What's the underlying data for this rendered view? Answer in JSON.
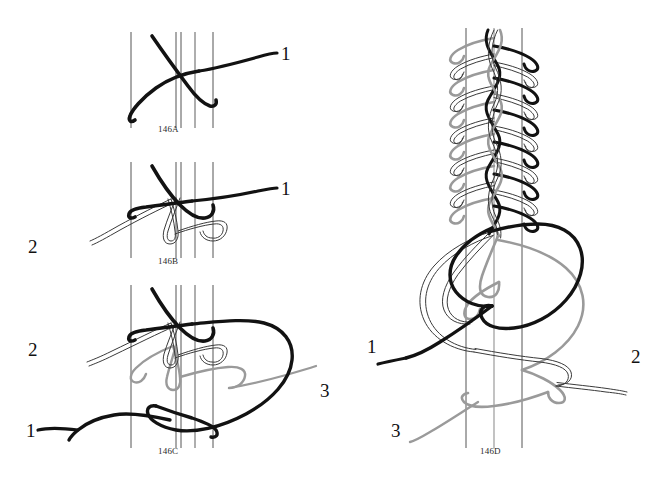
{
  "figure": {
    "background_color": "#ffffff",
    "width": 672,
    "height": 489
  },
  "palette": {
    "strand_black": "#121212",
    "strand_gray": "#9a9a9a",
    "strand_white_outline": "#3a3a3a",
    "core_line": "#555555",
    "core_line_gray": "#9a9a9a",
    "caption_color": "#2b2b2b",
    "label_color": "#111111"
  },
  "panels": [
    {
      "id": "146A",
      "caption": "146A",
      "strand_labels": [
        {
          "text": "1",
          "strand": "black"
        }
      ]
    },
    {
      "id": "146B",
      "caption": "146B",
      "strand_labels": [
        {
          "text": "1",
          "strand": "black"
        },
        {
          "text": "2",
          "strand": "white"
        }
      ]
    },
    {
      "id": "146C",
      "caption": "146C",
      "strand_labels": [
        {
          "text": "1",
          "strand": "black"
        },
        {
          "text": "2",
          "strand": "white"
        },
        {
          "text": "3",
          "strand": "gray"
        }
      ]
    },
    {
      "id": "146D",
      "caption": "146D",
      "strand_labels": [
        {
          "text": "1",
          "strand": "black"
        },
        {
          "text": "2",
          "strand": "white"
        },
        {
          "text": "3",
          "strand": "gray"
        }
      ]
    }
  ],
  "captions": {
    "a": "146A",
    "b": "146B",
    "c": "146C",
    "d": "146D"
  },
  "labels": {
    "a_1": "1",
    "b_1": "1",
    "b_2": "2",
    "c_1": "1",
    "c_2": "2",
    "c_3": "3",
    "d_1": "1",
    "d_2": "2",
    "d_3": "3"
  }
}
